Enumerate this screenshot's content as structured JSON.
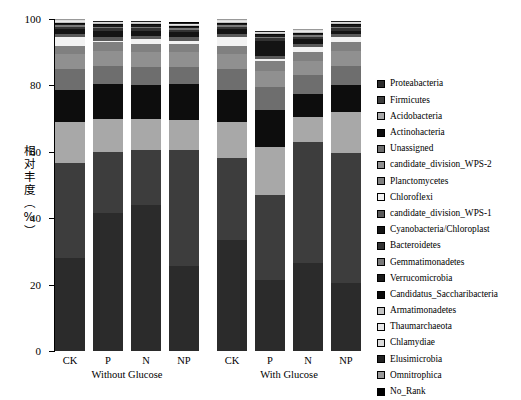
{
  "chart_data": {
    "type": "bar",
    "subtype": "stacked-percentage",
    "title": "",
    "xlabel": "",
    "ylabel": "相对丰度（%）",
    "ylim": [
      0,
      100
    ],
    "yticks": [
      0,
      20,
      40,
      60,
      80,
      100
    ],
    "ytick_labels": [
      "0",
      "20",
      "40",
      "60",
      "80",
      "100"
    ],
    "grid": false,
    "legend_position": "right",
    "categories": [
      "CK",
      "P",
      "N",
      "NP",
      "CK",
      "P",
      "N",
      "NP"
    ],
    "groups": [
      {
        "label": "Without Glucose",
        "categories": [
          "CK",
          "P",
          "N",
          "NP"
        ]
      },
      {
        "label": "With Glucose",
        "categories": [
          "CK",
          "P",
          "N",
          "NP"
        ]
      }
    ],
    "series": [
      {
        "name": "Proteabacteria",
        "color": "#2b2b2b",
        "values": [
          28.0,
          41.5,
          44.0,
          25.5,
          33.5,
          21.5,
          26.5,
          20.5
        ]
      },
      {
        "name": "Firmicutes",
        "color": "#3d3d3d",
        "values": [
          28.5,
          18.5,
          16.5,
          35.0,
          24.5,
          25.5,
          36.5,
          39.0
        ]
      },
      {
        "name": "Acidobacteria",
        "color": "#a8a8a8",
        "values": [
          12.5,
          10.0,
          9.5,
          9.0,
          11.0,
          14.5,
          7.5,
          12.5
        ]
      },
      {
        "name": "Actinohacteria",
        "color": "#0d0d0d",
        "values": [
          9.5,
          10.5,
          10.0,
          11.0,
          9.5,
          11.0,
          7.0,
          8.0
        ]
      },
      {
        "name": "Unassigned",
        "color": "#6e6e6e",
        "values": [
          6.5,
          5.5,
          5.5,
          5.0,
          6.5,
          7.0,
          5.5,
          6.0
        ]
      },
      {
        "name": "candidate_division_WPS-2",
        "color": "#909090",
        "values": [
          4.5,
          4.5,
          4.5,
          4.5,
          4.5,
          5.0,
          4.5,
          4.5
        ]
      },
      {
        "name": "Planctomycetes",
        "color": "#808080",
        "values": [
          2.5,
          2.5,
          2.5,
          2.5,
          2.5,
          3.0,
          2.5,
          2.5
        ]
      },
      {
        "name": "Chloroflexi",
        "color": "#f2f2f2",
        "values": [
          2.5,
          0.5,
          1.5,
          1.0,
          2.5,
          0.5,
          1.5,
          1.5
        ]
      },
      {
        "name": "candidate_division_WPS-1",
        "color": "#5a5a5a",
        "values": [
          1.0,
          1.0,
          1.0,
          1.0,
          1.0,
          1.0,
          1.0,
          1.0
        ]
      },
      {
        "name": "Cyanobacteria/Chloroplast",
        "color": "#141414",
        "values": [
          1.5,
          2.0,
          1.5,
          1.5,
          1.5,
          4.5,
          1.5,
          1.0
        ]
      },
      {
        "name": "Bacteroidetes",
        "color": "#333333",
        "values": [
          0.7,
          0.7,
          0.7,
          0.7,
          0.7,
          0.7,
          0.7,
          0.7
        ]
      },
      {
        "name": "Gemmatimonadetes",
        "color": "#7a7a7a",
        "values": [
          0.5,
          0.5,
          0.5,
          0.5,
          0.5,
          0.5,
          0.5,
          0.5
        ]
      },
      {
        "name": "Verrucomicrobia",
        "color": "#1a1a1a",
        "values": [
          0.4,
          0.4,
          0.4,
          0.4,
          0.4,
          0.4,
          0.4,
          0.4
        ]
      },
      {
        "name": "Candidatus_Saccharibacteria",
        "color": "#0a0a0a",
        "values": [
          0.3,
          0.3,
          0.3,
          0.3,
          0.3,
          0.3,
          0.3,
          0.3
        ]
      },
      {
        "name": "Armatimonadetes",
        "color": "#c4c4c4",
        "values": [
          0.3,
          0.3,
          0.3,
          0.3,
          0.3,
          0.3,
          0.3,
          0.3
        ]
      },
      {
        "name": "Thaumarchaeota",
        "color": "#e8e8e8",
        "values": [
          0.2,
          0.2,
          0.2,
          0.2,
          0.2,
          0.2,
          0.2,
          0.2
        ]
      },
      {
        "name": "Chlamydiae",
        "color": "#dcdcdc",
        "values": [
          0.2,
          0.2,
          0.2,
          0.2,
          0.2,
          0.2,
          0.2,
          0.2
        ]
      },
      {
        "name": "Elusimicrobia",
        "color": "#222222",
        "values": [
          0.2,
          0.2,
          0.2,
          0.2,
          0.2,
          0.2,
          0.2,
          0.2
        ]
      },
      {
        "name": "Omnitrophica",
        "color": "#999999",
        "values": [
          0.1,
          0.1,
          0.1,
          0.1,
          0.1,
          0.1,
          0.1,
          0.1
        ]
      },
      {
        "name": "No_Rank",
        "color": "#000000",
        "values": [
          0.1,
          0.1,
          0.1,
          0.1,
          0.1,
          0.1,
          0.1,
          0.1
        ]
      }
    ]
  }
}
